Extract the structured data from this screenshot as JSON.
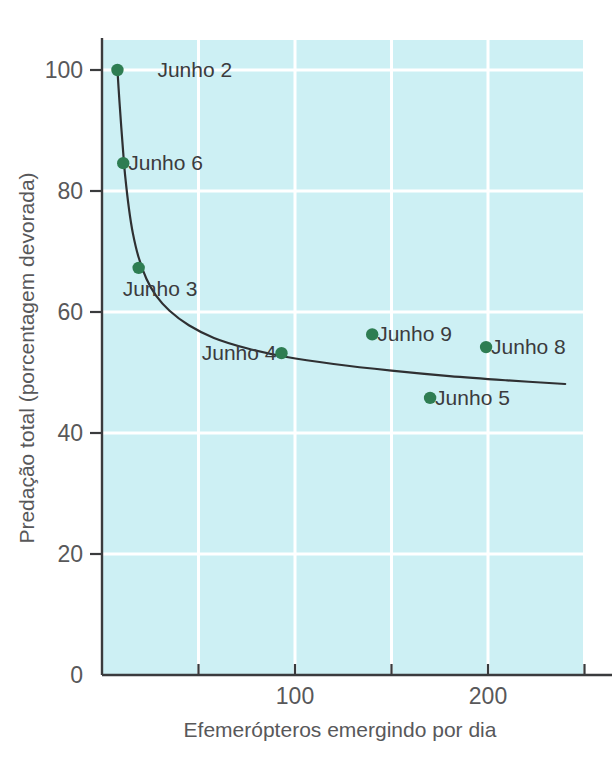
{
  "chart_data": {
    "type": "scatter",
    "title": "",
    "xlabel": "Efemerópteros emergindo por dia",
    "ylabel": "Predação total (porcentagem devorada)",
    "xlim": [
      0,
      250
    ],
    "ylim": [
      0,
      106
    ],
    "grid": true,
    "legend_position": "none",
    "x_ticks": [
      50,
      100,
      150,
      200,
      250
    ],
    "x_tick_labels": [
      "",
      "100",
      "",
      "200",
      ""
    ],
    "y_ticks": [
      0,
      20,
      40,
      60,
      80,
      100
    ],
    "y_tick_labels": [
      "0",
      "20",
      "40",
      "60",
      "80",
      "100"
    ],
    "point_color": "#2e7d52",
    "curve_color": "#2f3032",
    "plot_background": "#cdf0f4",
    "gridline_color": "#ffffff",
    "points": [
      {
        "label": "Junho 2",
        "x": 8,
        "y": 100.0,
        "label_side": "right",
        "label_gap": 40
      },
      {
        "label": "Junho 6",
        "x": 11,
        "y": 84.6,
        "label_side": "right",
        "label_gap": 5
      },
      {
        "label": "Junho 3",
        "x": 19,
        "y": 67.3,
        "label_side": "below-left",
        "label_gap": 5
      },
      {
        "label": "Junho 4",
        "x": 93,
        "y": 53.2,
        "label_side": "left",
        "label_gap": 5
      },
      {
        "label": "Junho 9",
        "x": 140,
        "y": 56.3,
        "label_side": "right",
        "label_gap": 5
      },
      {
        "label": "Junho 8",
        "x": 199,
        "y": 54.2,
        "label_side": "right",
        "label_gap": 5
      },
      {
        "label": "Junho 5",
        "x": 170,
        "y": 45.8,
        "label_side": "right",
        "label_gap": 5
      }
    ],
    "fitted_curve": {
      "description": "decaying hyperbolic fit through scatter",
      "points": [
        {
          "x": 8,
          "y": 100.0
        },
        {
          "x": 9,
          "y": 95.0
        },
        {
          "x": 10,
          "y": 90.5
        },
        {
          "x": 11,
          "y": 86.3
        },
        {
          "x": 12,
          "y": 82.5
        },
        {
          "x": 14,
          "y": 77.0
        },
        {
          "x": 16,
          "y": 73.0
        },
        {
          "x": 19,
          "y": 69.0
        },
        {
          "x": 23,
          "y": 65.5
        },
        {
          "x": 28,
          "y": 62.7
        },
        {
          "x": 35,
          "y": 60.2
        },
        {
          "x": 45,
          "y": 57.8
        },
        {
          "x": 58,
          "y": 55.7
        },
        {
          "x": 75,
          "y": 54.0
        },
        {
          "x": 95,
          "y": 52.6
        },
        {
          "x": 120,
          "y": 51.4
        },
        {
          "x": 150,
          "y": 50.3
        },
        {
          "x": 180,
          "y": 49.4
        },
        {
          "x": 210,
          "y": 48.7
        },
        {
          "x": 240,
          "y": 48.1
        }
      ]
    }
  }
}
